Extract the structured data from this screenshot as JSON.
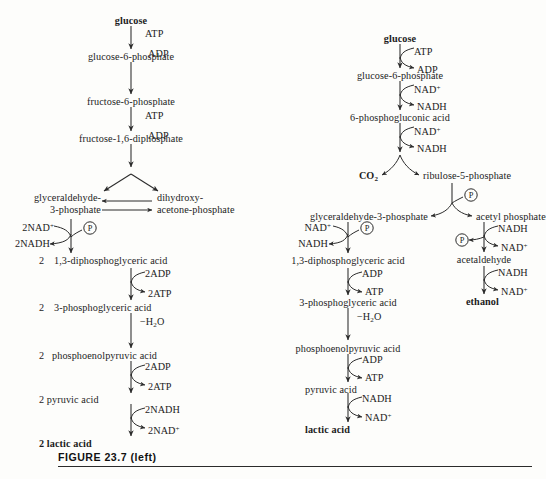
{
  "figure": {
    "caption": "FIGURE  23.7 (left)"
  },
  "pathways": {
    "left": {
      "name": "homolactic fermentation (glycolysis)",
      "nodes": {
        "n1": "glucose",
        "n2": "glucose-6-phosphate",
        "n3": "fructose-6-phosphate",
        "n4": "fructose-1,6-diphosphate",
        "n5a": "glyceraldehyde-",
        "n5b": "3-phosphate",
        "n5c": "dihydroxy-",
        "n5d": "acetone-phosphate",
        "n6num": "2",
        "n6": "1,3-diphosphoglyceric acid",
        "n7num": "2",
        "n7": "3-phosphoglyceric acid",
        "n8num": "2",
        "n8": "phosphoenolpyruvic  acid",
        "n9": "2 pyruvic acid",
        "n10": "2 lactic acid"
      },
      "cofactors": {
        "c1_in": "ATP",
        "c1_out": "ADP",
        "c2_in": "ATP",
        "c2_out": "ADP",
        "c3_in": "2NAD",
        "c3_in_sup": "+",
        "c3_out": "2NADH",
        "c3_p": "P",
        "c4_in": "2ADP",
        "c4_out": "2ATP",
        "c5": "−H",
        "c5_sub": "2",
        "c5_tail": "O",
        "c6_in": "2ADP",
        "c6_out": "2ATP",
        "c7_in": "2NADH",
        "c7_out": "2NAD",
        "c7_out_sup": "+"
      }
    },
    "right": {
      "name": "heterolactic fermentation (phosphoketolase pathway)",
      "nodes": {
        "r1": "glucose",
        "r2": "glucose-6-phosphate",
        "r3": "6-phosphogluconic acid",
        "r4a": "CO",
        "r4a_sub": "2",
        "r4b": "ribulose-5-phosphate",
        "r5a": "glyceraldehyde-3-phosphate",
        "r5b": "acetyl phosphate",
        "r6": "1,3-diphosphoglyceric acid",
        "r7": "3-phosphoglyceric acid",
        "r8": "phosphoenolpyruvic acid",
        "r9": "pyruvic acid",
        "r10": "lactic acid",
        "r11": "acetaldehyde",
        "r12": "ethanol"
      },
      "cofactors": {
        "d1_in": "ATP",
        "d1_out": "ADP",
        "d2_in": "NAD",
        "d2_in_sup": "+",
        "d2_out": "NADH",
        "d3_in": "NAD",
        "d3_in_sup": "+",
        "d3_out": "NADH",
        "d4_p": "P",
        "d5_in": "NAD",
        "d5_in_sup": "+",
        "d5_out": "NADH",
        "d5_p": "P",
        "d6_in": "ADP",
        "d6_out": "ATP",
        "d7": "−H",
        "d7_sub": "2",
        "d7_tail": "O",
        "d8_in": "ADP",
        "d8_out": "ATP",
        "d9_in": "NADH",
        "d9_out": "NAD",
        "d9_out_sup": "+",
        "e1_in": "NADH",
        "e1_out": "NAD",
        "e1_out_sup": "+",
        "e1_p": "P",
        "e2_in": "NADH",
        "e2_out": "NAD",
        "e2_out_sup": "+"
      }
    }
  },
  "colors": {
    "ink": "#1c1c1c",
    "stroke": "#2b2b2b",
    "paper": "#fdfdfb"
  }
}
